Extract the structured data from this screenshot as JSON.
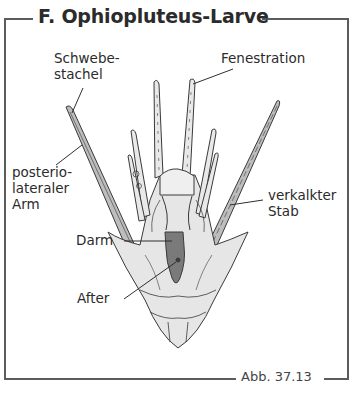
{
  "figure": {
    "title": "F. Ophiopluteus-Larve",
    "caption": "Abb. 37.13"
  },
  "labels": {
    "schwebestachel": [
      "Schwebe-",
      "stachel"
    ],
    "fenestration": "Fenestration",
    "posteriolateraler_arm": [
      "posterio-",
      "lateraler",
      "Arm"
    ],
    "verkalkter_stab": [
      "verkalkter",
      "Stab"
    ],
    "darm": "Darm",
    "after": "After"
  },
  "colors": {
    "frame": "#5c5c5c",
    "outline": "#3a3a3a",
    "body_fill": "#e6e6e6",
    "arm_fill": "#bdbdbd",
    "gut_fill": "#7a7a7a"
  }
}
